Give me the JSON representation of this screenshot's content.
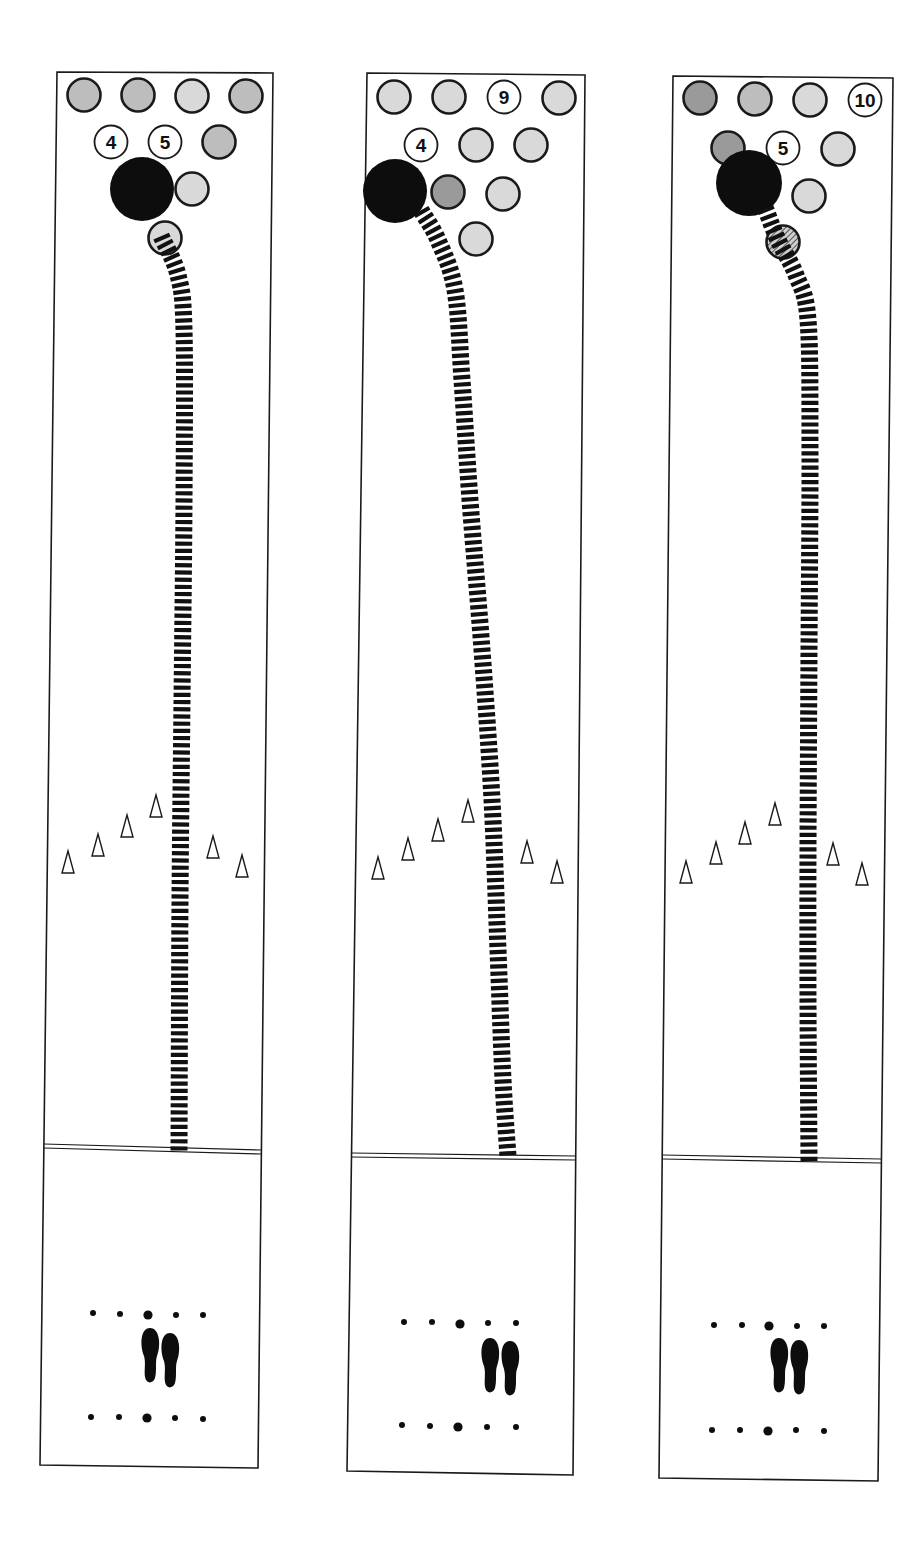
{
  "figure": {
    "colors": {
      "lane_line": "#1a1a1a",
      "ball": "#0d0d0d",
      "pin_fill_light": "#d9d9d9",
      "pin_fill_mid": "#bdbdbd",
      "pin_fill_dark": "#9a9a9a",
      "pin_standing_fill": "#ffffff",
      "path": "#111111",
      "background": "#ffffff"
    }
  },
  "lanes": [
    {
      "id": "lane-1",
      "frame": {
        "left_top": [
          57,
          72
        ],
        "right_top": [
          273,
          73
        ],
        "left_bottom": [
          40,
          1465
        ],
        "right_bottom": [
          258,
          1468
        ],
        "foul_y_left": 1146,
        "foul_y_right": 1152
      },
      "pins": [
        {
          "x": 84,
          "y": 95,
          "label": "",
          "state": "down",
          "shade": "mid"
        },
        {
          "x": 138,
          "y": 95,
          "label": "",
          "state": "down",
          "shade": "mid"
        },
        {
          "x": 192,
          "y": 96,
          "label": "",
          "state": "down",
          "shade": "light"
        },
        {
          "x": 246,
          "y": 96,
          "label": "",
          "state": "down",
          "shade": "mid"
        },
        {
          "x": 111,
          "y": 142,
          "label": "4",
          "state": "standing"
        },
        {
          "x": 165,
          "y": 142,
          "label": "5",
          "state": "standing"
        },
        {
          "x": 219,
          "y": 142,
          "label": "",
          "state": "down",
          "shade": "mid"
        },
        {
          "x": 192,
          "y": 189,
          "label": "",
          "state": "down",
          "shade": "light"
        },
        {
          "x": 165,
          "y": 238,
          "label": "",
          "state": "down",
          "shade": "light"
        }
      ],
      "ball": {
        "x": 142,
        "y": 189,
        "r": 32
      },
      "path": [
        [
          162,
          238
        ],
        [
          178,
          275
        ],
        [
          184,
          330
        ],
        [
          184,
          500
        ],
        [
          182,
          700
        ],
        [
          180,
          900
        ],
        [
          179,
          1150
        ]
      ],
      "arrows": [
        [
          68,
          862
        ],
        [
          98,
          845
        ],
        [
          127,
          826
        ],
        [
          156,
          806
        ],
        [
          213,
          847
        ],
        [
          242,
          866
        ]
      ],
      "dots_top": [
        [
          93,
          1313
        ],
        [
          120,
          1314
        ],
        [
          148,
          1315
        ],
        [
          176,
          1315
        ],
        [
          203,
          1315
        ]
      ],
      "dots_bottom": [
        [
          91,
          1417
        ],
        [
          119,
          1417
        ],
        [
          147,
          1418
        ],
        [
          175,
          1418
        ],
        [
          203,
          1419
        ]
      ],
      "feet": [
        {
          "x": 150,
          "y": 1350
        },
        {
          "x": 170,
          "y": 1355
        }
      ]
    },
    {
      "id": "lane-2",
      "frame": {
        "left_top": [
          367,
          73
        ],
        "right_top": [
          585,
          75
        ],
        "left_bottom": [
          347,
          1471
        ],
        "right_bottom": [
          573,
          1475
        ],
        "foul_y_left": 1155,
        "foul_y_right": 1158
      },
      "pins": [
        {
          "x": 394,
          "y": 97,
          "label": "",
          "state": "down",
          "shade": "light"
        },
        {
          "x": 449,
          "y": 97,
          "label": "",
          "state": "down",
          "shade": "light"
        },
        {
          "x": 504,
          "y": 97,
          "label": "9",
          "state": "standing"
        },
        {
          "x": 559,
          "y": 98,
          "label": "",
          "state": "down",
          "shade": "light"
        },
        {
          "x": 421,
          "y": 145,
          "label": "4",
          "state": "standing"
        },
        {
          "x": 476,
          "y": 145,
          "label": "",
          "state": "down",
          "shade": "light"
        },
        {
          "x": 531,
          "y": 145,
          "label": "",
          "state": "down",
          "shade": "light"
        },
        {
          "x": 448,
          "y": 192,
          "label": "",
          "state": "down",
          "shade": "dark"
        },
        {
          "x": 503,
          "y": 194,
          "label": "",
          "state": "down",
          "shade": "light"
        },
        {
          "x": 476,
          "y": 239,
          "label": "",
          "state": "down",
          "shade": "light"
        }
      ],
      "ball": {
        "x": 395,
        "y": 191,
        "r": 32
      },
      "path": [
        [
          422,
          212
        ],
        [
          438,
          240
        ],
        [
          455,
          290
        ],
        [
          462,
          380
        ],
        [
          470,
          500
        ],
        [
          482,
          650
        ],
        [
          492,
          800
        ],
        [
          498,
          950
        ],
        [
          503,
          1080
        ],
        [
          508,
          1156
        ]
      ],
      "arrows": [
        [
          378,
          868
        ],
        [
          408,
          849
        ],
        [
          438,
          830
        ],
        [
          468,
          811
        ],
        [
          527,
          852
        ],
        [
          557,
          872
        ]
      ],
      "dots_top": [
        [
          404,
          1322
        ],
        [
          432,
          1322
        ],
        [
          460,
          1324
        ],
        [
          488,
          1323
        ],
        [
          516,
          1323
        ]
      ],
      "dots_bottom": [
        [
          402,
          1425
        ],
        [
          430,
          1426
        ],
        [
          458,
          1427
        ],
        [
          487,
          1427
        ],
        [
          516,
          1427
        ]
      ],
      "feet": [
        {
          "x": 490,
          "y": 1360
        },
        {
          "x": 510,
          "y": 1363
        }
      ]
    },
    {
      "id": "lane-3",
      "frame": {
        "left_top": [
          673,
          76
        ],
        "right_top": [
          893,
          78
        ],
        "left_bottom": [
          659,
          1478
        ],
        "right_bottom": [
          878,
          1481
        ],
        "foul_y_left": 1157,
        "foul_y_right": 1161
      },
      "pins": [
        {
          "x": 700,
          "y": 98,
          "label": "",
          "state": "down",
          "shade": "dark"
        },
        {
          "x": 755,
          "y": 99,
          "label": "",
          "state": "down",
          "shade": "mid"
        },
        {
          "x": 810,
          "y": 100,
          "label": "",
          "state": "down",
          "shade": "light"
        },
        {
          "x": 865,
          "y": 100,
          "label": "10",
          "state": "standing"
        },
        {
          "x": 728,
          "y": 148,
          "label": "",
          "state": "down",
          "shade": "dark"
        },
        {
          "x": 783,
          "y": 148,
          "label": "5",
          "state": "standing"
        },
        {
          "x": 838,
          "y": 149,
          "label": "",
          "state": "down",
          "shade": "light"
        },
        {
          "x": 809,
          "y": 196,
          "label": "",
          "state": "down",
          "shade": "light"
        },
        {
          "x": 783,
          "y": 242,
          "label": "",
          "state": "down",
          "shade": "hatched"
        }
      ],
      "ball": {
        "x": 749,
        "y": 183,
        "r": 33
      },
      "path": [
        [
          766,
          210
        ],
        [
          778,
          240
        ],
        [
          796,
          275
        ],
        [
          808,
          320
        ],
        [
          810,
          450
        ],
        [
          809,
          650
        ],
        [
          808,
          850
        ],
        [
          808,
          1000
        ],
        [
          809,
          1160
        ]
      ],
      "arrows": [
        [
          686,
          872
        ],
        [
          716,
          853
        ],
        [
          745,
          833
        ],
        [
          775,
          814
        ],
        [
          833,
          854
        ],
        [
          862,
          874
        ]
      ],
      "dots_top": [
        [
          714,
          1325
        ],
        [
          742,
          1325
        ],
        [
          769,
          1326
        ],
        [
          797,
          1326
        ],
        [
          824,
          1326
        ]
      ],
      "dots_bottom": [
        [
          712,
          1430
        ],
        [
          740,
          1430
        ],
        [
          768,
          1431
        ],
        [
          796,
          1430
        ],
        [
          824,
          1431
        ]
      ],
      "feet": [
        {
          "x": 779,
          "y": 1360
        },
        {
          "x": 799,
          "y": 1362
        }
      ]
    }
  ]
}
